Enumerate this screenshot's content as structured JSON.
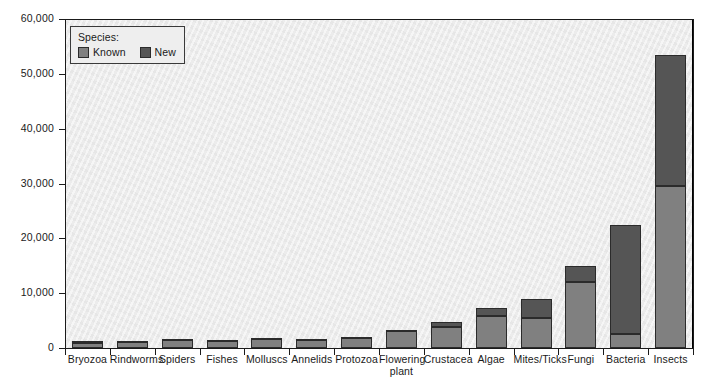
{
  "chart_data": {
    "type": "bar",
    "subtype": "stacked-bar",
    "title": "",
    "xlabel": "",
    "ylabel": "",
    "ylim": [
      0,
      60000
    ],
    "ytick_values": [
      0,
      10000,
      20000,
      30000,
      40000,
      50000,
      60000
    ],
    "ytick_labels": [
      "0",
      "10,000",
      "20,000",
      "30,000",
      "40,000",
      "50,000",
      "60,000"
    ],
    "grid": false,
    "legend_position": "top-left-inside",
    "legend_title": "Species:",
    "categories": [
      "Bryozoa",
      "Rindworms",
      "Spiders",
      "Fishes",
      "Molluscs",
      "Annelids",
      "Protozoa",
      "Flowering\nplant",
      "Crustacea",
      "Algae",
      "Mites/Ticks",
      "Fungi",
      "Bacteria",
      "Insects"
    ],
    "series": [
      {
        "name": "Known",
        "color": "#808080",
        "values": [
          900,
          1100,
          1500,
          1200,
          1700,
          1400,
          1800,
          3100,
          3900,
          5900,
          5500,
          12100,
          2500,
          29500
        ]
      },
      {
        "name": "New",
        "color": "#555555",
        "values": [
          300,
          150,
          200,
          300,
          200,
          250,
          250,
          150,
          900,
          1400,
          3500,
          2900,
          19900,
          23900
        ]
      }
    ],
    "totals": [
      1200,
      1250,
      1700,
      1500,
      1900,
      1650,
      2050,
      3250,
      4800,
      7300,
      9000,
      15000,
      22400,
      53400
    ]
  },
  "legend": {
    "title": "Species:",
    "items": [
      {
        "label": "Known",
        "color": "#808080"
      },
      {
        "label": "New",
        "color": "#555555"
      }
    ]
  },
  "colors": {
    "known": "#808080",
    "new": "#555555",
    "plot_background": "#ececec",
    "axis": "#1a1a1a",
    "page_background": "#ffffff"
  }
}
